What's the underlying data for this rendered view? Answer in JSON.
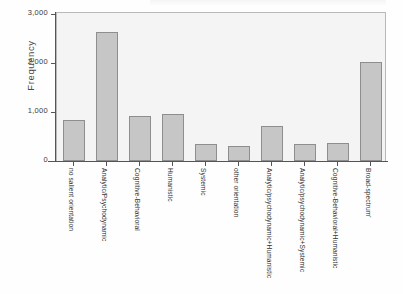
{
  "chart_data": {
    "type": "bar",
    "title": "",
    "subtitle": "",
    "xlabel": "",
    "ylabel": "Frequency",
    "ylim": [
      0,
      3000
    ],
    "yticks": [
      0,
      1000,
      2000,
      3000
    ],
    "ytick_labels": [
      "0",
      "1,000",
      "2,000",
      "3,000"
    ],
    "grid": false,
    "legend": null,
    "categories": [
      "no salient orientation",
      "Analytic/Psychodynamic",
      "Cognitive-Behavioral",
      "Humanistic",
      "Systemic",
      "other orientation",
      "Analytic/psychodynamic+Humanistic",
      "Analytic/psychodynamic+Systemic",
      "Cognitive-Behavioral+Humanistic",
      "Broad-spectrum'"
    ],
    "values": [
      837,
      2643,
      918,
      959,
      347,
      306,
      714,
      347,
      367,
      2020
    ],
    "bar_color": "#c6c6c6",
    "bar_edge_color": "#8e8e8e",
    "plot_background": "#f4f4f4",
    "axis_color": "#555555"
  }
}
